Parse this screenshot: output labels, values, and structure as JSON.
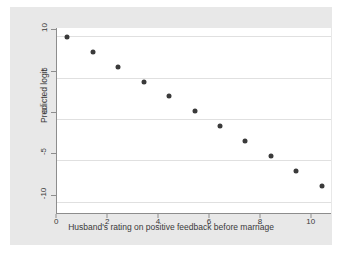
{
  "chart_data": {
    "type": "scatter",
    "title": "",
    "subtitle": "",
    "xlabel": "Husband's rating on positive feedback before marriage",
    "ylabel": "Predicted logit",
    "x": [
      0,
      1,
      2,
      3,
      4,
      5,
      6,
      7,
      8,
      9,
      10
    ],
    "values": [
      9.9,
      8.1,
      6.3,
      4.5,
      2.8,
      0.9,
      -0.9,
      -2.7,
      -4.5,
      -6.3,
      -8.1
    ],
    "series": [
      {
        "name": "Predicted logit",
        "values": [
          9.9,
          8.1,
          6.3,
          4.5,
          2.8,
          0.9,
          -0.9,
          -2.7,
          -4.5,
          -6.3,
          -8.1
        ]
      }
    ],
    "xlim": [
      -0.4,
      10.4
    ],
    "ylim": [
      -11.5,
      11.0
    ],
    "xticks": [
      0,
      2,
      4,
      6,
      8,
      10
    ],
    "xtick_labels": [
      "0",
      "2",
      "4",
      "6",
      "8",
      "10"
    ],
    "yticks": [
      10,
      5,
      0,
      -5,
      -10
    ],
    "ytick_labels": [
      "10",
      "5",
      "0",
      "-5",
      "-10"
    ],
    "grid": "horizontal",
    "legend": "none",
    "marker_color": "#3a3a3a",
    "gridline_color": "#e0e0e0",
    "plot_background": "#ffffff",
    "graph_background": "#e8e8e8",
    "axis_color": "#8d8d8d"
  }
}
